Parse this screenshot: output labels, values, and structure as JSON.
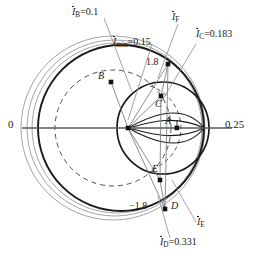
{
  "figure": {
    "type": "circle-diagram"
  },
  "axis": {
    "left_label": "0",
    "right_label": "0.25"
  },
  "annotations": {
    "i_b": {
      "symbol": "I",
      "subscript": "B",
      "value": "=0.1",
      "overbar": true
    },
    "i_min": {
      "symbol": "I",
      "subscript": "min",
      "value": "=0.15",
      "overbar": true
    },
    "i_c": {
      "symbol": "I",
      "subscript": "C",
      "value": "=0.183",
      "overbar": true
    },
    "i_f": {
      "symbol": "I",
      "subscript": "F",
      "value": "",
      "overbar": true
    },
    "i_e": {
      "symbol": "I",
      "subscript": "E",
      "value": "",
      "overbar": true
    },
    "i_d": {
      "symbol": "I",
      "subscript": "D",
      "value": "=0.331",
      "overbar": true
    }
  },
  "markers": {
    "slip_top": "1.8",
    "slip_bottom": "−1.8"
  },
  "points": [
    {
      "id": "point-a",
      "label": "A",
      "x": 177,
      "y": 128
    },
    {
      "id": "point-b",
      "label": "B",
      "x": 111,
      "y": 82
    },
    {
      "id": "point-c",
      "label": "C",
      "x": 161,
      "y": 96
    },
    {
      "id": "point-d",
      "label": "D",
      "x": 165,
      "y": 209
    },
    {
      "id": "point-e",
      "label": "E",
      "x": 160,
      "y": 180
    },
    {
      "id": "point-f",
      "label": "",
      "x": 168,
      "y": 64
    }
  ],
  "colors": {
    "ink": "#1a1a1a",
    "thin": "#888888",
    "mid": "#666666",
    "background": "#ffffff"
  }
}
